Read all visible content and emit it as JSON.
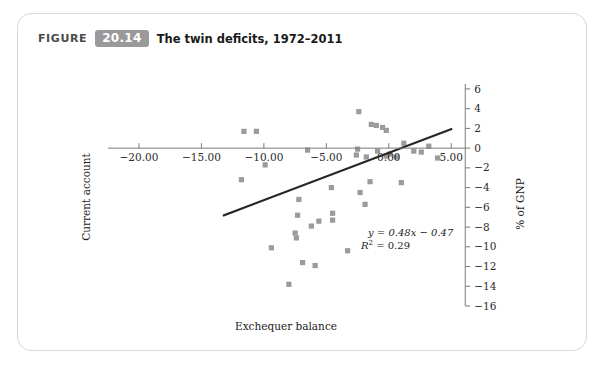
{
  "figure": {
    "word": "FIGURE",
    "number": "20.14",
    "caption": "The twin deficits, 1972–2011"
  },
  "colors": {
    "marker": "#9b9b9b",
    "trendline": "#262626",
    "axis": "#7a7a7a",
    "badge": "#9a9a9a",
    "card_border": "#d8d8d8"
  },
  "chart_data": {
    "type": "scatter",
    "title": "The twin deficits, 1972–2011",
    "xlabel": "Exchequer balance",
    "ylabel": "Current account",
    "y2label": "% of GNP",
    "xlim": [
      -22.0,
      6.5
    ],
    "ylim": [
      -16.0,
      6.5
    ],
    "xticks": [
      -20.0,
      -15.0,
      -10.0,
      -5.0,
      0.0,
      5.0
    ],
    "xticklabels": [
      "−20.00",
      "−15.00",
      "−10.00",
      "−5.00",
      "0.00",
      "5.00"
    ],
    "yticks": [
      6,
      4,
      2,
      0,
      -2,
      -4,
      -6,
      -8,
      -10,
      -12,
      -14,
      -16
    ],
    "yticklabels": [
      "6",
      "4",
      "2",
      "0",
      "−2",
      "−4",
      "−6",
      "−8",
      "−10",
      "−12",
      "−14",
      "−16"
    ],
    "grid": false,
    "legend": false,
    "annotation_equation": "y = 0.48x − 0.47",
    "annotation_r2_prefix": "R",
    "annotation_r2_exp": "2",
    "annotation_r2_value": " = 0.29",
    "trendline": {
      "slope": 0.48,
      "intercept": -0.47,
      "r_squared": 0.29,
      "x_start": -13.2,
      "x_end": 5.0
    },
    "points": [
      {
        "x": -11.6,
        "y": 1.7
      },
      {
        "x": -10.6,
        "y": 1.7
      },
      {
        "x": -11.8,
        "y": -3.2
      },
      {
        "x": -9.9,
        "y": -1.7
      },
      {
        "x": -6.5,
        "y": -0.2
      },
      {
        "x": -4.6,
        "y": -4.0
      },
      {
        "x": -7.2,
        "y": -5.2
      },
      {
        "x": -7.3,
        "y": -6.8
      },
      {
        "x": -6.2,
        "y": -7.9
      },
      {
        "x": -7.5,
        "y": -8.6
      },
      {
        "x": -7.4,
        "y": -9.1
      },
      {
        "x": -5.6,
        "y": -7.4
      },
      {
        "x": -4.5,
        "y": -6.6
      },
      {
        "x": -4.5,
        "y": -7.3
      },
      {
        "x": -9.4,
        "y": -10.1
      },
      {
        "x": -8.0,
        "y": -13.8
      },
      {
        "x": -6.9,
        "y": -11.6
      },
      {
        "x": -5.9,
        "y": -11.9
      },
      {
        "x": -3.3,
        "y": -10.4
      },
      {
        "x": -2.4,
        "y": 3.7
      },
      {
        "x": -1.4,
        "y": 2.4
      },
      {
        "x": -1.0,
        "y": 2.3
      },
      {
        "x": -0.5,
        "y": 2.1
      },
      {
        "x": -0.2,
        "y": 1.8
      },
      {
        "x": -2.5,
        "y": -0.1
      },
      {
        "x": -2.6,
        "y": -0.7
      },
      {
        "x": -1.8,
        "y": -0.9
      },
      {
        "x": -0.9,
        "y": -0.3
      },
      {
        "x": -0.2,
        "y": -0.8
      },
      {
        "x": 0.1,
        "y": -0.6
      },
      {
        "x": 0.6,
        "y": -0.9
      },
      {
        "x": 1.2,
        "y": 0.5
      },
      {
        "x": 2.0,
        "y": -0.3
      },
      {
        "x": 2.6,
        "y": -0.4
      },
      {
        "x": 3.9,
        "y": -1.0
      },
      {
        "x": -1.5,
        "y": -3.4
      },
      {
        "x": -2.3,
        "y": -4.5
      },
      {
        "x": 1.0,
        "y": -3.5
      },
      {
        "x": -1.9,
        "y": -5.7
      },
      {
        "x": 3.2,
        "y": 0.2
      }
    ]
  }
}
